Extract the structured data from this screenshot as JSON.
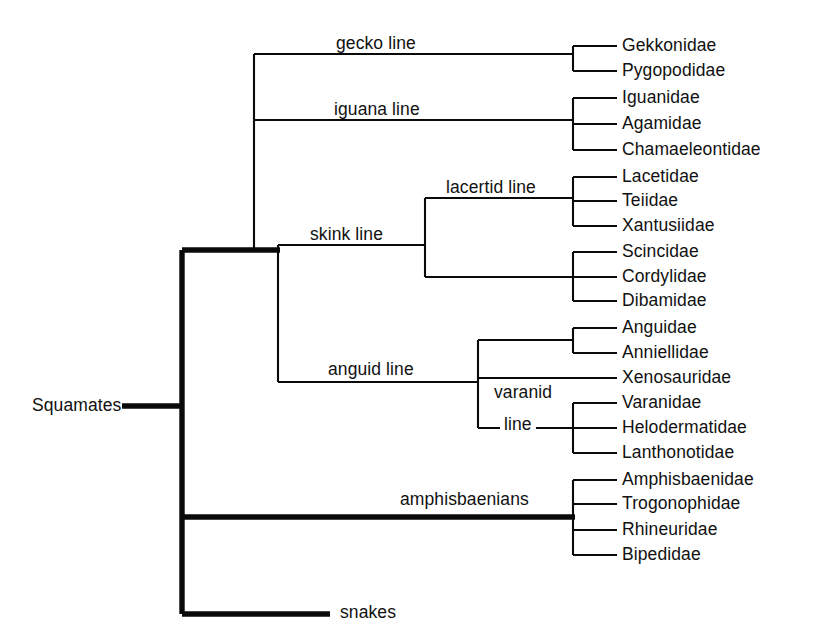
{
  "figure": {
    "type": "cladogram",
    "background_color": "#ffffff",
    "line_color": "#0a0a0a"
  },
  "root": {
    "label": "Squamates",
    "x": 32,
    "y": 406
  },
  "node_labels": [
    {
      "id": "gecko-line",
      "text": "gecko line",
      "x": 332,
      "y": 44,
      "align": "left"
    },
    {
      "id": "iguana-line",
      "text": "iguana line",
      "x": 330,
      "y": 110,
      "align": "left"
    },
    {
      "id": "lacertid-line",
      "text": "lacertid line",
      "x": 442,
      "y": 188,
      "align": "left"
    },
    {
      "id": "skink-line",
      "text": "skink line",
      "x": 306,
      "y": 235,
      "align": "left"
    },
    {
      "id": "anguid-line",
      "text": "anguid line",
      "x": 324,
      "y": 370,
      "align": "left"
    },
    {
      "id": "varanid-word",
      "text": "varanid",
      "x": 490,
      "y": 393,
      "align": "left"
    },
    {
      "id": "varanid-line-word",
      "text": "line",
      "x": 500,
      "y": 425,
      "align": "left"
    },
    {
      "id": "amphisbaenians",
      "text": "amphisbaenians",
      "x": 396,
      "y": 500,
      "align": "left"
    },
    {
      "id": "snakes",
      "text": "snakes",
      "x": 336,
      "y": 613,
      "align": "left"
    }
  ],
  "leaves": [
    {
      "id": "gekkonidae",
      "text": "Gekkonidae",
      "y": 46,
      "group": "gecko"
    },
    {
      "id": "pygopodidae",
      "text": "Pygopodidae",
      "y": 71,
      "group": "gecko"
    },
    {
      "id": "iguanidae",
      "text": "Iguanidae",
      "y": 98,
      "group": "iguana"
    },
    {
      "id": "agamidae",
      "text": "Agamidae",
      "y": 124,
      "group": "iguana"
    },
    {
      "id": "chamaeleontidae",
      "text": "Chamaeleontidae",
      "y": 150,
      "group": "iguana"
    },
    {
      "id": "lacetidae",
      "text": "Lacetidae",
      "y": 177,
      "group": "lacertid"
    },
    {
      "id": "teiidae",
      "text": "Teiidae",
      "y": 201,
      "group": "lacertid"
    },
    {
      "id": "xantusiidae",
      "text": "Xantusiidae",
      "y": 226,
      "group": "lacertid"
    },
    {
      "id": "scincidae",
      "text": "Scincidae",
      "y": 252,
      "group": "skink"
    },
    {
      "id": "cordylidae",
      "text": "Cordylidae",
      "y": 277,
      "group": "skink"
    },
    {
      "id": "dibamidae",
      "text": "Dibamidae",
      "y": 301,
      "group": "skink"
    },
    {
      "id": "anguidae",
      "text": "Anguidae",
      "y": 328,
      "group": "anguid"
    },
    {
      "id": "anniellidae",
      "text": "Anniellidae",
      "y": 353,
      "group": "anguid"
    },
    {
      "id": "xenosauridae",
      "text": "Xenosauridae",
      "y": 378,
      "group": "anguid"
    },
    {
      "id": "varanidae",
      "text": "Varanidae",
      "y": 403,
      "group": "varanid"
    },
    {
      "id": "helodermatidae",
      "text": "Helodermatidae",
      "y": 428,
      "group": "varanid"
    },
    {
      "id": "lanthonotidae",
      "text": "Lanthonotidae",
      "y": 453,
      "group": "varanid"
    },
    {
      "id": "amphisbaenidae",
      "text": "Amphisbaenidae",
      "y": 480,
      "group": "amphisbaenian"
    },
    {
      "id": "trogonophidae",
      "text": "Trogonophidae",
      "y": 504,
      "group": "amphisbaenian"
    },
    {
      "id": "rhineuridae",
      "text": "Rhineuridae",
      "y": 530,
      "group": "amphisbaenian"
    },
    {
      "id": "bipedidae",
      "text": "Bipedidae",
      "y": 555,
      "group": "amphisbaenian"
    }
  ],
  "leaf_geometry": {
    "tip_x": 617,
    "label_x": 622,
    "cluster_stem_x": 573
  },
  "branches": [
    {
      "id": "root-stub",
      "kind": "thick",
      "x1": 122,
      "y1": 406,
      "x2": 182,
      "y2": 406
    },
    {
      "id": "main-trunk",
      "kind": "thick",
      "x1": 182,
      "y1": 250,
      "x2": 182,
      "y2": 614
    },
    {
      "id": "lizards-branch",
      "kind": "thick",
      "x1": 182,
      "y1": 250,
      "x2": 280,
      "y2": 250
    },
    {
      "id": "amphisbaenians-branch",
      "kind": "thick",
      "x1": 182,
      "y1": 517,
      "x2": 575,
      "y2": 517
    },
    {
      "id": "snakes-branch",
      "kind": "thick",
      "x1": 182,
      "y1": 614,
      "x2": 330,
      "y2": 614
    },
    {
      "id": "lizards-spine",
      "kind": "thin",
      "x1": 254,
      "y1": 54,
      "x2": 254,
      "y2": 250
    },
    {
      "id": "gecko-branch",
      "kind": "thin",
      "x1": 254,
      "y1": 54,
      "x2": 573,
      "y2": 54
    },
    {
      "id": "iguana-branch",
      "kind": "thin",
      "x1": 254,
      "y1": 120,
      "x2": 573,
      "y2": 120
    },
    {
      "id": "skink-spine",
      "kind": "thin",
      "x1": 278,
      "y1": 245,
      "x2": 278,
      "y2": 382
    },
    {
      "id": "skink-branch",
      "kind": "thin",
      "x1": 278,
      "y1": 245,
      "x2": 425,
      "y2": 245
    },
    {
      "id": "lacertid-spine",
      "kind": "thin",
      "x1": 425,
      "y1": 198,
      "x2": 425,
      "y2": 277
    },
    {
      "id": "lacertid-branch",
      "kind": "thin",
      "x1": 425,
      "y1": 198,
      "x2": 573,
      "y2": 198
    },
    {
      "id": "scincid-branch",
      "kind": "thin",
      "x1": 425,
      "y1": 277,
      "x2": 573,
      "y2": 277
    },
    {
      "id": "anguid-branch",
      "kind": "thin",
      "x1": 278,
      "y1": 382,
      "x2": 478,
      "y2": 382
    },
    {
      "id": "anguid-spine",
      "kind": "thin",
      "x1": 478,
      "y1": 340,
      "x2": 478,
      "y2": 428
    },
    {
      "id": "anguidae-pair-branch",
      "kind": "thin",
      "x1": 478,
      "y1": 340,
      "x2": 573,
      "y2": 340
    },
    {
      "id": "xenosaurid-branch",
      "kind": "thin",
      "x1": 478,
      "y1": 378,
      "x2": 617,
      "y2": 378
    },
    {
      "id": "varanid-branch",
      "kind": "thin",
      "x1": 478,
      "y1": 428,
      "x2": 573,
      "y2": 428
    },
    {
      "id": "gecko-cluster-spine",
      "kind": "thin",
      "x1": 573,
      "y1": 46,
      "x2": 573,
      "y2": 71
    },
    {
      "id": "iguana-cluster-spine",
      "kind": "thin",
      "x1": 573,
      "y1": 98,
      "x2": 573,
      "y2": 150
    },
    {
      "id": "lacertid-cluster-spine",
      "kind": "thin",
      "x1": 573,
      "y1": 177,
      "x2": 573,
      "y2": 226
    },
    {
      "id": "skink-cluster-spine",
      "kind": "thin",
      "x1": 573,
      "y1": 252,
      "x2": 573,
      "y2": 301
    },
    {
      "id": "anguid-cluster-spine",
      "kind": "thin",
      "x1": 573,
      "y1": 328,
      "x2": 573,
      "y2": 353
    },
    {
      "id": "varanid-cluster-spine",
      "kind": "thin",
      "x1": 573,
      "y1": 403,
      "x2": 573,
      "y2": 453
    },
    {
      "id": "amphis-cluster-spine",
      "kind": "thin",
      "x1": 573,
      "y1": 480,
      "x2": 573,
      "y2": 555
    }
  ],
  "groups": [
    {
      "id": "gecko",
      "label": "gecko line",
      "members": [
        "Gekkonidae",
        "Pygopodidae"
      ]
    },
    {
      "id": "iguana",
      "label": "iguana line",
      "members": [
        "Iguanidae",
        "Agamidae",
        "Chamaeleontidae"
      ]
    },
    {
      "id": "lacertid",
      "label": "lacertid line",
      "members": [
        "Lacetidae",
        "Teiidae",
        "Xantusiidae"
      ]
    },
    {
      "id": "skink",
      "label": "skink line",
      "members": [
        "Scincidae",
        "Cordylidae",
        "Dibamidae"
      ]
    },
    {
      "id": "anguid",
      "label": "anguid line",
      "members": [
        "Anguidae",
        "Anniellidae",
        "Xenosauridae"
      ]
    },
    {
      "id": "varanid",
      "label": "varanid line",
      "members": [
        "Varanidae",
        "Helodermatidae",
        "Lanthonotidae"
      ]
    },
    {
      "id": "amphisbaenian",
      "label": "amphisbaenians",
      "members": [
        "Amphisbaenidae",
        "Trogonophidae",
        "Rhineuridae",
        "Bipedidae"
      ]
    },
    {
      "id": "snakes",
      "label": "snakes",
      "members": []
    }
  ]
}
